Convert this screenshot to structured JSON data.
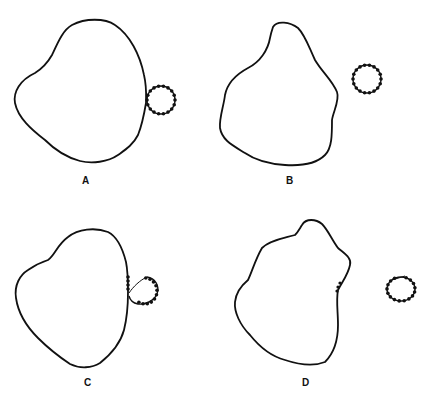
{
  "panels": [
    {
      "id": "A",
      "label": "A",
      "description": "Cell with attached beaded loop touching boundary"
    },
    {
      "id": "B",
      "label": "B",
      "description": "Cell with separate beaded ring, not touching"
    },
    {
      "id": "C",
      "label": "C",
      "description": "Beaded loop partially merging into cell membrane"
    },
    {
      "id": "D",
      "label": "D",
      "description": "Beads left in membrane; ring detached with linking segment"
    }
  ],
  "colors": {
    "stroke": "#111111",
    "background": "#ffffff"
  }
}
